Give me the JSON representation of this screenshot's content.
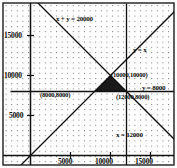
{
  "chart_data": {
    "type": "line",
    "title": "",
    "xlabel": "",
    "ylabel": "",
    "xlim": [
      -2500,
      19500
    ],
    "ylim": [
      -2000,
      19000
    ],
    "grid": "dotted",
    "legend_position": "inline-annotations",
    "axis_ticks": {
      "x": [
        5000,
        10000,
        15000
      ],
      "y": [
        5000,
        10000,
        15000
      ],
      "x_labels": [
        "5000",
        "10000",
        "15000"
      ],
      "y_labels": [
        "5000",
        "10000",
        "15000"
      ]
    },
    "series": [
      {
        "name": "x + y = 20000",
        "type": "line",
        "label": "x + y = 20000",
        "x": [
          -2500,
          19500
        ],
        "y": [
          22500,
          500
        ]
      },
      {
        "name": "y = x",
        "type": "line",
        "label": "y = x",
        "x": [
          -2000,
          19000
        ],
        "y": [
          -2000,
          19000
        ]
      },
      {
        "name": "y = 8000",
        "type": "line",
        "label": "y = 8000",
        "x": [
          -2500,
          19500
        ],
        "y": [
          8000,
          8000
        ]
      },
      {
        "name": "x = 12000",
        "type": "line",
        "label": "x = 12000",
        "x": [
          12000,
          12000
        ],
        "y": [
          -2000,
          19000
        ]
      }
    ],
    "shaded_region": {
      "fill": "#1a1a1a",
      "vertices": [
        [
          8000,
          8000
        ],
        [
          10000,
          10000
        ],
        [
          12000,
          8000
        ]
      ]
    },
    "annotations": [
      {
        "name": "vertex-label-left",
        "text": "(8000,8000)",
        "x": 8000,
        "y": 8000
      },
      {
        "name": "vertex-label-top",
        "text": "(10000,10000)",
        "x": 10000,
        "y": 10000
      },
      {
        "name": "vertex-label-right",
        "text": "(12000,8000)",
        "x": 12000,
        "y": 8000
      }
    ]
  },
  "labels": {
    "line_sum": "x + y = 20000",
    "line_identity": "y = x",
    "line_horizontal": "y = 8000",
    "line_vertical": "x = 12000",
    "point_top": "(10000,10000)",
    "point_left": "(8000,8000)",
    "point_right": "(12000,8000)",
    "y_tick_15000": "15000",
    "y_tick_10000": "10000",
    "y_tick_5000": "5000",
    "x_tick_5000": "5000",
    "x_tick_10000": "10000",
    "x_tick_15000": "15000"
  },
  "colors": {
    "line": "#111111",
    "axis": "#000000",
    "grid_dot": "#777777",
    "region_fill": "#1a1a1a",
    "background": "#fdfdfd"
  }
}
